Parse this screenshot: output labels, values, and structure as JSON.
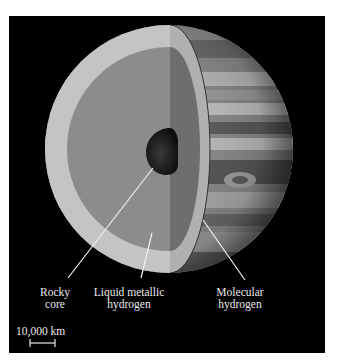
{
  "figure": {
    "background_color": "#000000",
    "layers": [
      {
        "id": "rocky-core",
        "label_line1": "Rocky",
        "label_line2": "core",
        "color": "#1e1e1e"
      },
      {
        "id": "liquid-metallic-hydrogen",
        "label_line1": "Liquid metallic",
        "label_line2": "hydrogen",
        "color": "#8c8c8c"
      },
      {
        "id": "molecular-hydrogen",
        "label_line1": "Molecular",
        "label_line2": "hydrogen",
        "color": "#c4c4c4"
      }
    ],
    "scale_bar": {
      "label": "10,000 km"
    }
  }
}
